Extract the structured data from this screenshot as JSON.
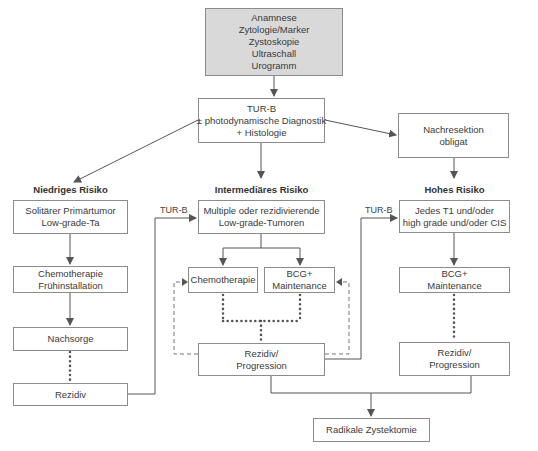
{
  "diagram": {
    "top_box": [
      "Anamnese",
      "Zytologie/Marker",
      "Zystoskopie",
      "Ultraschall",
      "Urogramm"
    ],
    "turb_box": [
      "TUR-B",
      "± photodynamische Diagnostik",
      "+ Histologie"
    ],
    "nachresektion_box": [
      "Nachresektion",
      "obligat"
    ],
    "columns": {
      "low": {
        "heading": "Niedriges Risiko",
        "box1": [
          "Solitärer Primärtumor",
          "Low-grade-Ta"
        ],
        "box2": [
          "Chemotherapie",
          "Frühinstallation"
        ],
        "box3": [
          "Nachsorge"
        ],
        "box4": [
          "Rezidiv"
        ]
      },
      "intermediate": {
        "heading": "Intermediäres Risiko",
        "box1": [
          "Multiple oder rezidivierende",
          "Low-grade-Tumoren"
        ],
        "chemo": [
          "Chemotherapie"
        ],
        "bcg": [
          "BCG+",
          "Maintenance"
        ],
        "rezidiv": [
          "Rezidiv/",
          "Progression"
        ]
      },
      "high": {
        "heading": "Hohes Risiko",
        "box1": [
          "Jedes T1 und/oder",
          "high grade und/oder CIS"
        ],
        "bcg": [
          "BCG+",
          "Maintenance"
        ],
        "rezidiv": [
          "Rezidiv/",
          "Progression"
        ]
      }
    },
    "edge_labels": {
      "turb_left": "TUR-B",
      "turb_right": "TUR-B"
    },
    "final_box": [
      "Radikale Zystektomie"
    ],
    "colors": {
      "line": "#555555",
      "border": "#8c8c8c",
      "top_fill": "#d9d9d9"
    }
  }
}
